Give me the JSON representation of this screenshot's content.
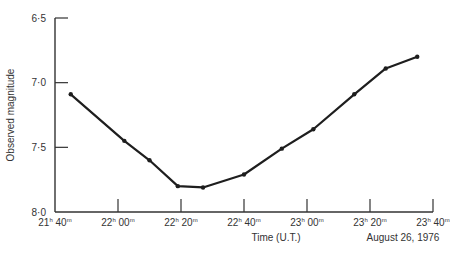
{
  "chart_data": {
    "type": "line",
    "title": "",
    "xlabel": "Time (U.T.)",
    "ylabel": "Observed magnitude",
    "annotation": "August 26, 1976",
    "x_ticks": [
      "21h 40m",
      "22h 00m",
      "22h 20m",
      "22h 40m",
      "23h 00m",
      "23h 20m",
      "23h 40m"
    ],
    "x_tick_minutes": [
      1300,
      1320,
      1340,
      1360,
      1380,
      1400,
      1420
    ],
    "y_ticks": [
      "6·5",
      "7·0",
      "7·5",
      "8·0"
    ],
    "y_tick_values": [
      6.5,
      7.0,
      7.5,
      8.0
    ],
    "ylim": [
      8.0,
      6.5
    ],
    "y_inverted": true,
    "xlim_minutes": [
      1300,
      1420
    ],
    "grid": false,
    "series": [
      {
        "name": "Observed magnitude",
        "x_minutes": [
          1305,
          1322,
          1330,
          1339,
          1347,
          1360,
          1372,
          1382,
          1395,
          1405,
          1415
        ],
        "x": [
          "21h 45m",
          "22h 02m",
          "22h 10m",
          "22h 19m",
          "22h 27m",
          "22h 40m",
          "22h 52m",
          "23h 02m",
          "23h 15m",
          "23h 25m",
          "23h 35m"
        ],
        "values": [
          7.09,
          7.45,
          7.6,
          7.8,
          7.81,
          7.71,
          7.51,
          7.36,
          7.09,
          6.89,
          6.8
        ]
      }
    ]
  },
  "labels": {
    "x_tick_hours": [
      "21",
      "22",
      "22",
      "22",
      "23",
      "23",
      "23"
    ],
    "x_tick_mins": [
      "40",
      "00",
      "20",
      "40",
      "00",
      "20",
      "40"
    ],
    "h_sup": "h",
    "m_sup": "m"
  },
  "colors": {
    "line": "#1e1e1e",
    "axis": "#333333",
    "text": "#333333"
  }
}
